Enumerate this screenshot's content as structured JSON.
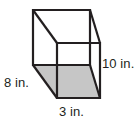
{
  "figure": {
    "shape_name": "rectangular-prism",
    "projection": "oblique",
    "colors": {
      "edge": "#231f20",
      "base_fill": "#c6c6c6",
      "background": "#ffffff",
      "label_text": "#231f20"
    },
    "labels": {
      "depth": "8 in.",
      "width": "3 in.",
      "height": "10 in."
    },
    "dimensions": {
      "depth_value": 8,
      "width_value": 3,
      "height_value": 10,
      "unit": "in."
    },
    "geometry": {
      "back_top_left": [
        33,
        10
      ],
      "back_top_right": [
        90,
        10
      ],
      "back_bottom_left": [
        33,
        65
      ],
      "back_bottom_right": [
        90,
        65
      ],
      "front_top_left": [
        57,
        43
      ],
      "front_top_right": [
        100,
        43
      ],
      "front_bottom_left": [
        57,
        98
      ],
      "front_bottom_right": [
        100,
        98
      ],
      "shaded_face": "bottom"
    }
  }
}
